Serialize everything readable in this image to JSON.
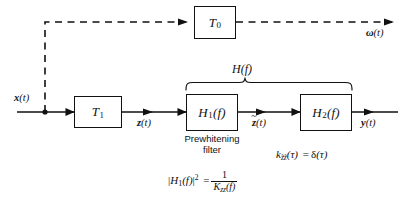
{
  "diagram": {
    "stroke_color": "#111111",
    "background": "#ffffff",
    "blocks": [
      {
        "id": "T0",
        "label": "T",
        "sub": "0"
      },
      {
        "id": "T1",
        "label": "T",
        "sub": "1"
      },
      {
        "id": "H1",
        "label": "H",
        "sub": "1",
        "arg": "(f)"
      },
      {
        "id": "H2",
        "label": "H",
        "sub": "2",
        "arg": "(f)"
      }
    ],
    "signals": {
      "input": "x",
      "input_arg": "(t)",
      "omega": "ω",
      "omega_arg": "(t)",
      "z": "z",
      "z_arg": "(t)",
      "z_tilde": "z",
      "z_tilde_arg": "(t)",
      "tilde_mark": "~",
      "output": "y",
      "output_arg": "(t)"
    },
    "annotations": {
      "brace_label": "H(f)",
      "brace_label_base": "H",
      "brace_label_arg": "(f)",
      "prewhitening_line1": "Prewhitening",
      "prewhitening_line2": "filter",
      "formula_h1_lhs_open": "|",
      "formula_h1_base": "H",
      "formula_h1_sub": "1",
      "formula_h1_arg": "(f)",
      "formula_h1_close": "|",
      "formula_h1_exp": "2",
      "formula_h1_eq": "=",
      "formula_h1_num": "1",
      "formula_h1_den_base": "K",
      "formula_h1_den_sub": "zz",
      "formula_h1_den_arg": "(f)",
      "formula_k_base": "k",
      "formula_k_sub": "z̃z̃",
      "formula_k_sub_plain": "zz",
      "formula_k_arg": "(τ)",
      "formula_k_eq": "=",
      "formula_k_delta": "δ",
      "formula_k_delta_arg": "(τ)"
    }
  }
}
